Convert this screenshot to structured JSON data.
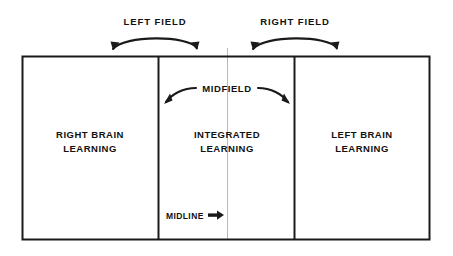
{
  "figure": {
    "type": "diagram",
    "background_color": "#ffffff",
    "line_color": "#1a1a1a",
    "midline_color": "#b4b4b4"
  },
  "top_labels": [
    {
      "text": "LEFT FIELD",
      "name": "left-field-label"
    },
    {
      "text": "RIGHT FIELD",
      "name": "right-field-label"
    }
  ],
  "panels": [
    {
      "name": "right-brain-panel",
      "line1": "RIGHT BRAIN",
      "line2": "LEARNING"
    },
    {
      "name": "integrated-panel",
      "line1": "INTEGRATED",
      "line2": "LEARNING"
    },
    {
      "name": "left-brain-panel",
      "line1": "LEFT BRAIN",
      "line2": "LEARNING"
    }
  ],
  "inner_labels": {
    "midfield": "MIDFIELD",
    "midline": "MIDLINE"
  },
  "arcs": [
    {
      "name": "left-field-arc",
      "label": "LEFT FIELD",
      "double_headed": true
    },
    {
      "name": "right-field-arc",
      "label": "RIGHT FIELD",
      "double_headed": true
    },
    {
      "name": "midfield-arc",
      "label": "MIDFIELD",
      "double_headed": true
    }
  ],
  "pointers": [
    {
      "name": "midline-pointer",
      "label": "MIDLINE",
      "direction": "right"
    }
  ]
}
